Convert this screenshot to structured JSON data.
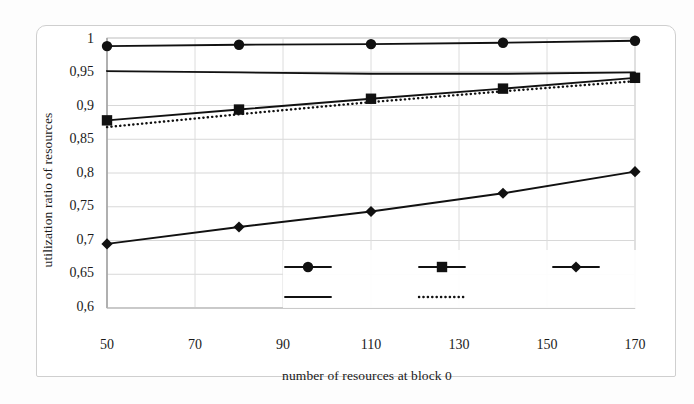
{
  "chart_data": {
    "type": "line",
    "title": "",
    "subtitle": "",
    "xlabel": "number of resources at block 0",
    "ylabel": "utilization ratio of resources",
    "x": [
      50,
      80,
      110,
      140,
      170
    ],
    "xlim": [
      50,
      170
    ],
    "ylim": [
      0.6,
      1.0
    ],
    "xticks": [
      50,
      70,
      90,
      110,
      130,
      150,
      170
    ],
    "xtick_labels": [
      "50",
      "70",
      "90",
      "110",
      "130",
      "150",
      "170"
    ],
    "yticks": [
      0.6,
      0.65,
      0.7,
      0.75,
      0.8,
      0.85,
      0.9,
      0.95,
      1.0
    ],
    "ytick_labels": [
      "0,6",
      "0,65",
      "0,7",
      "0,75",
      "0,8",
      "0,85",
      "0,9",
      "0,95",
      "1"
    ],
    "grid": true,
    "legend_position": "inside-lower-center",
    "series": [
      {
        "name": "1",
        "marker": "circle",
        "linestyle": "solid",
        "color": "#111111",
        "values": [
          0.988,
          0.99,
          0.991,
          0.993,
          0.996
        ]
      },
      {
        "name": "2",
        "marker": "square",
        "linestyle": "solid",
        "color": "#111111",
        "values": [
          0.878,
          0.894,
          0.91,
          0.925,
          0.941
        ]
      },
      {
        "name": "3",
        "marker": "diamond",
        "linestyle": "solid",
        "color": "#111111",
        "values": [
          0.695,
          0.72,
          0.743,
          0.77,
          0.802
        ]
      },
      {
        "name": "0",
        "marker": "none",
        "linestyle": "solid",
        "color": "#111111",
        "values": [
          0.951,
          0.949,
          0.947,
          0.947,
          0.949
        ]
      },
      {
        "name": "total",
        "marker": "none",
        "linestyle": "dotted",
        "color": "#111111",
        "values": [
          0.868,
          0.887,
          0.905,
          0.921,
          0.936
        ]
      }
    ]
  },
  "legend": {
    "entries": [
      {
        "label": "1",
        "marker": "circle",
        "linestyle": "solid"
      },
      {
        "label": "2",
        "marker": "square",
        "linestyle": "solid"
      },
      {
        "label": "3",
        "marker": "diamond",
        "linestyle": "solid"
      },
      {
        "label": "0",
        "marker": "none",
        "linestyle": "solid"
      },
      {
        "label": "total",
        "marker": "none",
        "linestyle": "dotted"
      }
    ]
  },
  "axes": {
    "y_title": "utilization ratio of resources",
    "x_title": "number of resources at block 0"
  }
}
